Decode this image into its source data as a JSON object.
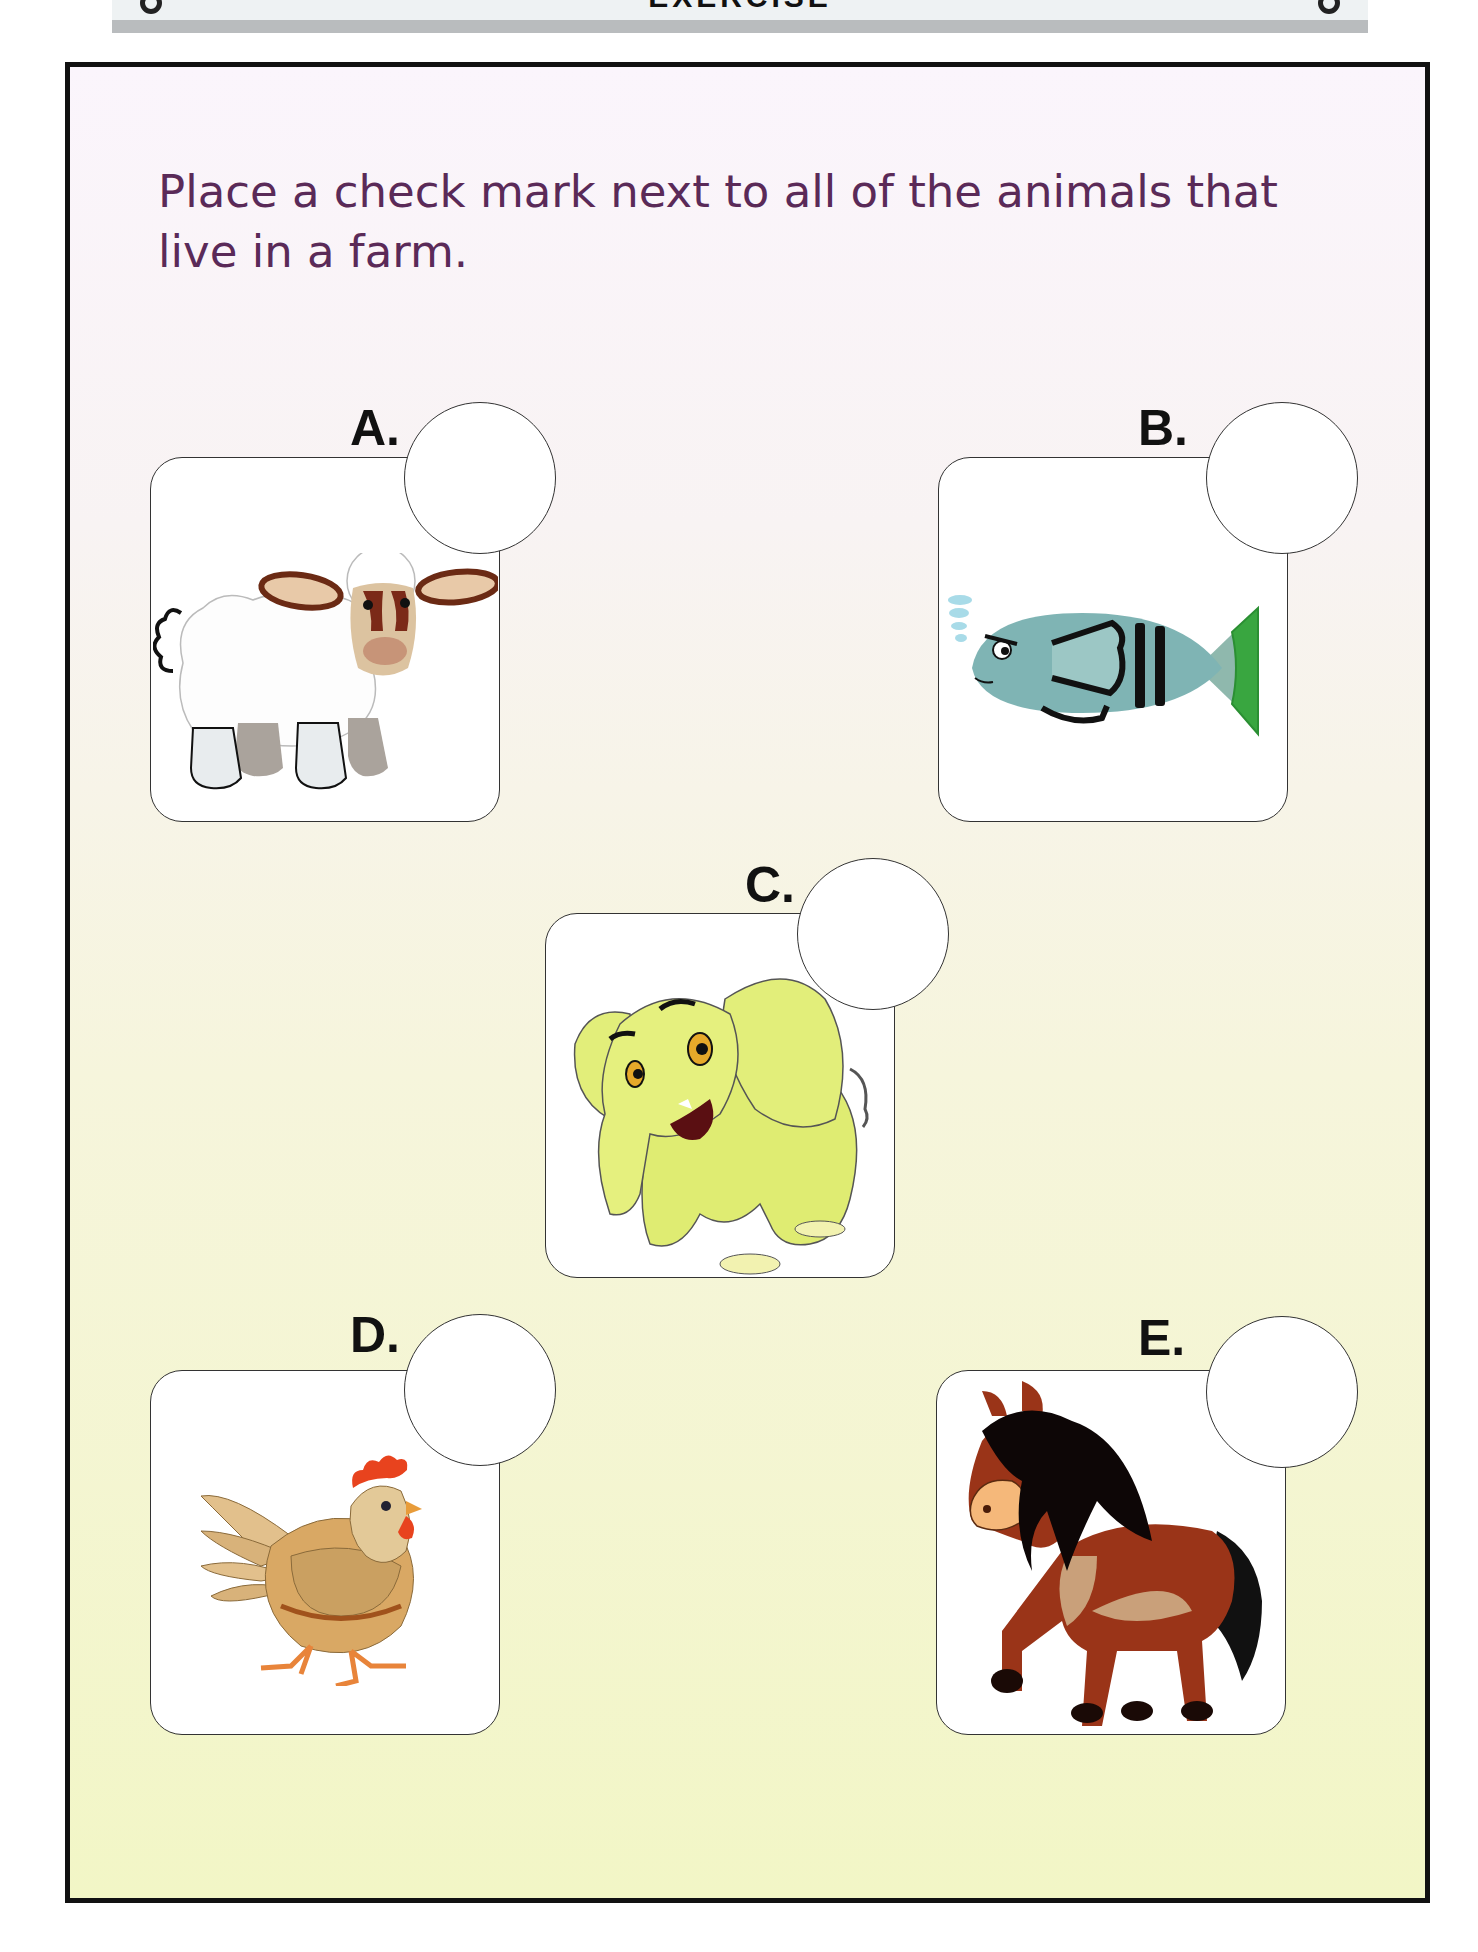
{
  "banner": {
    "title": "EXERCISE"
  },
  "instruction": "Place a check mark next to all of the animals that live in a farm.",
  "colors": {
    "instruction_text": "#5a2a58",
    "frame_border": "#111111",
    "bg_top": "#fbf5fc",
    "bg_bottom": "#f2f6c6"
  },
  "options": [
    {
      "label": "A.",
      "animal": "sheep",
      "icon": "sheep-icon",
      "checked": false
    },
    {
      "label": "B.",
      "animal": "fish",
      "icon": "fish-icon",
      "checked": false
    },
    {
      "label": "C.",
      "animal": "elephant",
      "icon": "elephant-icon",
      "checked": false
    },
    {
      "label": "D.",
      "animal": "hen",
      "icon": "hen-icon",
      "checked": false
    },
    {
      "label": "E.",
      "animal": "horse",
      "icon": "horse-icon",
      "checked": false
    }
  ]
}
